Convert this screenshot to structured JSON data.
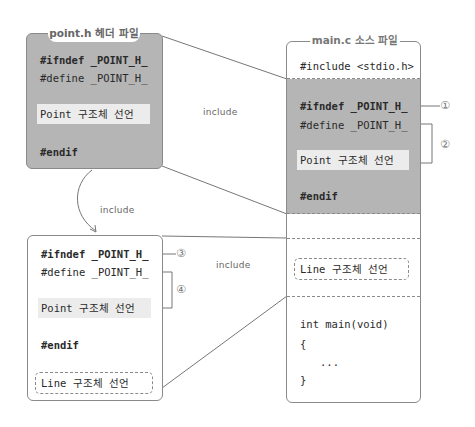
{
  "header_file": {
    "title": "point.h 헤더 파일",
    "lines": {
      "ifndef": "#ifndef _POINT_H_",
      "define": "#define _POINT_H_",
      "point_decl": "Point 구조체 선언",
      "endif": "#endif"
    }
  },
  "main_file": {
    "title": "main.c 소스 파일",
    "include_stdio": "#include <stdio.h>",
    "lines": {
      "ifndef": "#ifndef _POINT_H_",
      "define": "#define _POINT_H_",
      "point_decl": "Point 구조체 선언",
      "endif": "#endif"
    },
    "line_decl": "Line 구조체 선언",
    "main_code": {
      "signature": "int main(void)",
      "open_brace": "{",
      "ellipsis": "...",
      "close_brace": "}"
    }
  },
  "line_header": {
    "lines": {
      "ifndef": "#ifndef _POINT_H_",
      "define": "#define _POINT_H_",
      "point_decl": "Point 구조체 선언",
      "endif": "#endif",
      "line_decl": "Line 구조체 선언"
    }
  },
  "labels": {
    "include_top": "include",
    "include_curve": "include",
    "include_bottom": "include"
  },
  "markers": {
    "m1": "①",
    "m2": "②",
    "m3": "③",
    "m4": "④"
  },
  "colors": {
    "gray_fill": "#b5b5b5",
    "highlight": "#ececec",
    "border": "#8a8a8a"
  }
}
